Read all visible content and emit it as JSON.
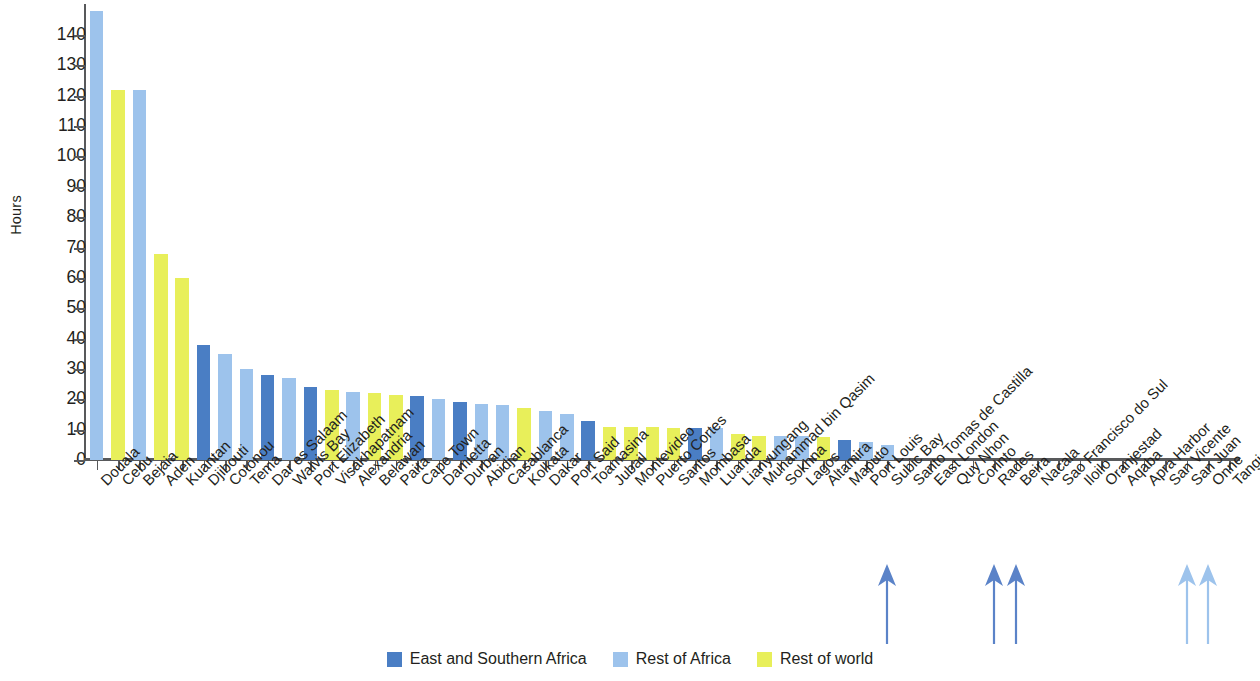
{
  "colors": {
    "east_southern_africa": "#4a7ec4",
    "rest_of_africa": "#9dc3ec",
    "rest_of_world": "#e8ef5a",
    "axis": "#58595b",
    "text": "#231f20",
    "arrow_dark": "#5b83c8",
    "arrow_light": "#9dc3ec"
  },
  "legend": {
    "items": [
      {
        "label": "East and Southern Africa",
        "key": "east_southern_africa"
      },
      {
        "label": "Rest of Africa",
        "key": "rest_of_africa"
      },
      {
        "label": "Rest of world",
        "key": "rest_of_world"
      }
    ]
  },
  "chart_data": {
    "type": "bar",
    "title": "",
    "subtitle": "",
    "xlabel": "",
    "ylabel": "Hours",
    "ylim": [
      0,
      148
    ],
    "yticks": [
      0,
      10,
      20,
      30,
      40,
      50,
      60,
      70,
      80,
      90,
      100,
      110,
      120,
      130,
      140
    ],
    "ytick_labels": [
      "0",
      "10",
      "20",
      "30",
      "40",
      "50",
      "60",
      "70",
      "80",
      "90",
      "100",
      "110",
      "120",
      "130",
      "140"
    ],
    "grid": false,
    "legend_position": "bottom-center",
    "annotations": [
      {
        "type": "arrow",
        "label": "",
        "category": "Subic Bay",
        "color_key": "arrow_dark"
      },
      {
        "type": "arrow",
        "label": "",
        "category": "Rades",
        "color_key": "arrow_dark"
      },
      {
        "type": "arrow",
        "label": "",
        "category": "Beira",
        "color_key": "arrow_dark"
      },
      {
        "type": "arrow",
        "label": "",
        "category": "San Juan",
        "color_key": "arrow_light"
      },
      {
        "type": "arrow",
        "label": "",
        "category": "Onne",
        "color_key": "arrow_light"
      }
    ],
    "categories": [
      "Douala",
      "Cebu",
      "Bejaia",
      "Aden",
      "Kuantan",
      "Djibouti",
      "Cotonou",
      "Tema",
      "Dar es Salaam",
      "Walvis Bay",
      "Port Elizabeth",
      "Visakhapatnam",
      "Alexandria",
      "Belawan",
      "Paita",
      "Cape Town",
      "Damietta",
      "Durban",
      "Abidjan",
      "Casablanca",
      "Kolkata",
      "Dakar",
      "Port Said",
      "Toamasina",
      "Jubail",
      "Montevideo",
      "Puerto Cortes",
      "Santos",
      "Mombasa",
      "Luanda",
      "Lianyungang",
      "Muhammad bin Qasim",
      "Sokhna",
      "Lagos",
      "Altamira",
      "Maputo",
      "Port Louis",
      "Subic Bay",
      "Santo Tomas de Castilla",
      "East London",
      "Quy Nhon",
      "Corinto",
      "Rades",
      "Beira",
      "Nacala",
      "Sao Francisco do Sul",
      "Iloilo",
      "Oranjestad",
      "Aqaba",
      "Apra Harbor",
      "San Vicente",
      "San Juan",
      "Onne",
      "Tangier"
    ],
    "values": [
      148,
      122,
      122,
      68,
      60,
      38,
      35,
      30,
      28,
      27,
      24,
      23,
      22.5,
      22,
      21.5,
      21,
      20,
      19,
      18.5,
      18,
      17,
      16,
      15,
      13,
      11,
      11,
      11,
      10.5,
      10.5,
      10.5,
      8.5,
      8,
      8,
      8,
      7.5,
      6.5,
      6,
      5,
      0,
      0,
      0,
      0,
      0,
      0,
      0,
      0,
      0,
      0,
      0,
      0,
      0,
      0,
      0,
      0
    ],
    "group_of": [
      "rest_of_africa",
      "rest_of_world",
      "rest_of_africa",
      "rest_of_world",
      "rest_of_world",
      "east_southern_africa",
      "rest_of_africa",
      "rest_of_africa",
      "east_southern_africa",
      "rest_of_africa",
      "east_southern_africa",
      "rest_of_world",
      "rest_of_africa",
      "rest_of_world",
      "rest_of_world",
      "east_southern_africa",
      "rest_of_africa",
      "east_southern_africa",
      "rest_of_africa",
      "rest_of_africa",
      "rest_of_world",
      "rest_of_africa",
      "rest_of_africa",
      "east_southern_africa",
      "rest_of_world",
      "rest_of_world",
      "rest_of_world",
      "rest_of_world",
      "east_southern_africa",
      "rest_of_africa",
      "rest_of_world",
      "rest_of_world",
      "rest_of_africa",
      "rest_of_africa",
      "rest_of_world",
      "east_southern_africa",
      "rest_of_africa",
      "rest_of_africa",
      "rest_of_world",
      "east_southern_africa",
      "rest_of_world",
      "rest_of_world",
      "rest_of_africa",
      "east_southern_africa",
      "east_southern_africa",
      "rest_of_world",
      "rest_of_world",
      "rest_of_world",
      "rest_of_africa",
      "rest_of_world",
      "rest_of_world",
      "rest_of_world",
      "rest_of_africa",
      "rest_of_africa"
    ]
  }
}
